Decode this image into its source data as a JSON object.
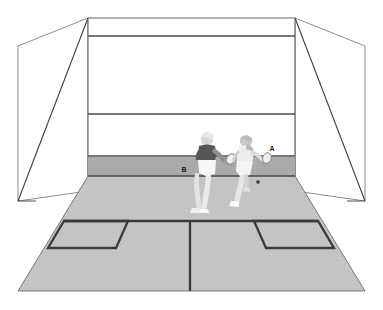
{
  "diagram": {
    "view": "one-point-perspective-from-back",
    "background_color": "#ffffff"
  },
  "colors": {
    "background": "#ffffff",
    "floor": "#c2c2c2",
    "floor_texture": "#bdbdbd",
    "front_wall": "#ffffff",
    "side_wall": "#ffffff",
    "tin_band": "#a8a8a8",
    "court_line_dark": "#3a3a3a",
    "wall_line": "#4a4a4a",
    "outline_thin": "#6e6e6e",
    "shirt_dark": "#565656",
    "shirt_light": "#ededed",
    "shorts_white": "#f5f5f5",
    "skin_shade": "#9a9a9a",
    "racket_head": "#efefef",
    "racket_outline": "#8a8a8a",
    "ball": "#3d3d3d",
    "label_text": "#1a1a1a"
  },
  "court": {
    "walls": {
      "front_wall_label": "front-wall",
      "left_side_wall_label": "left-side-wall",
      "right_side_wall_label": "right-side-wall"
    },
    "lines": [
      {
        "name": "out-line-front-wall",
        "y": 36,
        "description": "top out line across front wall"
      },
      {
        "name": "service-line",
        "y": 114,
        "description": "front wall service line"
      },
      {
        "name": "tin-top-line",
        "y": 156,
        "description": "top edge of the tin / board"
      },
      {
        "name": "floor-wall-junction",
        "y": 176,
        "description": "bottom of front wall at floor"
      },
      {
        "name": "short-line",
        "y": 232,
        "description": "short line across the floor"
      },
      {
        "name": "half-court-line",
        "x": 190,
        "description": "half court line running back from short line"
      }
    ],
    "service_boxes": [
      {
        "name": "left-service-box",
        "side": "left"
      },
      {
        "name": "right-service-box",
        "side": "right"
      }
    ]
  },
  "players": [
    {
      "id": "player-b",
      "label": "B",
      "label_x": 184,
      "label_y": 170,
      "shirt": "dark",
      "shorts": "white",
      "pose": "stepping-forward-left",
      "holding_racket": true
    },
    {
      "id": "player-a",
      "label": "A",
      "label_x": 272,
      "label_y": 150,
      "shirt": "light",
      "shorts": "white",
      "pose": "crouched-lunging-right",
      "holding_racket": true
    }
  ],
  "equipment": {
    "ball": {
      "name": "squash-ball",
      "x": 258,
      "y": 182,
      "radius": 1.6
    },
    "rackets": [
      {
        "name": "racket-player-b",
        "owner": "B"
      },
      {
        "name": "racket-player-a",
        "owner": "A"
      }
    ]
  }
}
